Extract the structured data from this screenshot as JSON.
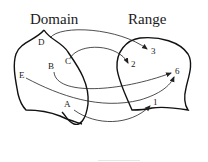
{
  "titles": {
    "domain": "Domain",
    "range": "Range"
  },
  "domain_points": [
    {
      "label": "D",
      "x": 45,
      "y": 42
    },
    {
      "label": "C",
      "x": 62,
      "y": 61
    },
    {
      "label": "B",
      "x": 48,
      "y": 69
    },
    {
      "label": "E",
      "x": 19,
      "y": 77
    },
    {
      "label": "A",
      "x": 64,
      "y": 107
    }
  ],
  "range_points": [
    {
      "label": "3",
      "x": 151,
      "y": 52
    },
    {
      "label": "2",
      "x": 131,
      "y": 66
    },
    {
      "label": "6",
      "x": 174,
      "y": 73
    },
    {
      "label": "1",
      "x": 152,
      "y": 104
    }
  ],
  "mappings": [
    {
      "from": "D",
      "to": "3"
    },
    {
      "from": "C",
      "to": "2"
    },
    {
      "from": "B",
      "to": "6"
    },
    {
      "from": "E",
      "to": "6"
    },
    {
      "from": "A",
      "to": "1"
    }
  ],
  "colors": {
    "stroke": "#111111",
    "text": "#1a1a1a",
    "background": "#ffffff"
  }
}
